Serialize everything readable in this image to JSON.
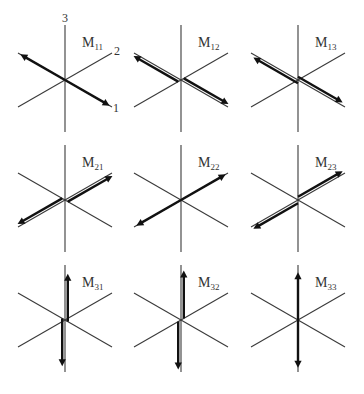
{
  "axis_labels": [
    "1",
    "2",
    "3"
  ],
  "components": [
    {
      "name": "M",
      "subscript": "11",
      "row": 1,
      "col": 1,
      "type": "dipole",
      "axis": 1,
      "force_axis": 1,
      "arm_axis": 1
    },
    {
      "name": "M",
      "subscript": "12",
      "row": 1,
      "col": 2,
      "type": "couple",
      "force_axis": 1,
      "arm_axis": 2
    },
    {
      "name": "M",
      "subscript": "13",
      "row": 1,
      "col": 3,
      "type": "couple",
      "force_axis": 1,
      "arm_axis": 3
    },
    {
      "name": "M",
      "subscript": "21",
      "row": 2,
      "col": 1,
      "type": "couple",
      "force_axis": 2,
      "arm_axis": 1
    },
    {
      "name": "M",
      "subscript": "22",
      "row": 2,
      "col": 2,
      "type": "dipole",
      "force_axis": 2,
      "arm_axis": 2
    },
    {
      "name": "M",
      "subscript": "23",
      "row": 2,
      "col": 3,
      "type": "couple",
      "force_axis": 2,
      "arm_axis": 3
    },
    {
      "name": "M",
      "subscript": "31",
      "row": 3,
      "col": 1,
      "type": "couple",
      "force_axis": 3,
      "arm_axis": 1
    },
    {
      "name": "M",
      "subscript": "32",
      "row": 3,
      "col": 2,
      "type": "couple",
      "force_axis": 3,
      "arm_axis": 2
    },
    {
      "name": "M",
      "subscript": "33",
      "row": 3,
      "col": 3,
      "type": "dipole",
      "force_axis": 3,
      "arm_axis": 3
    }
  ]
}
